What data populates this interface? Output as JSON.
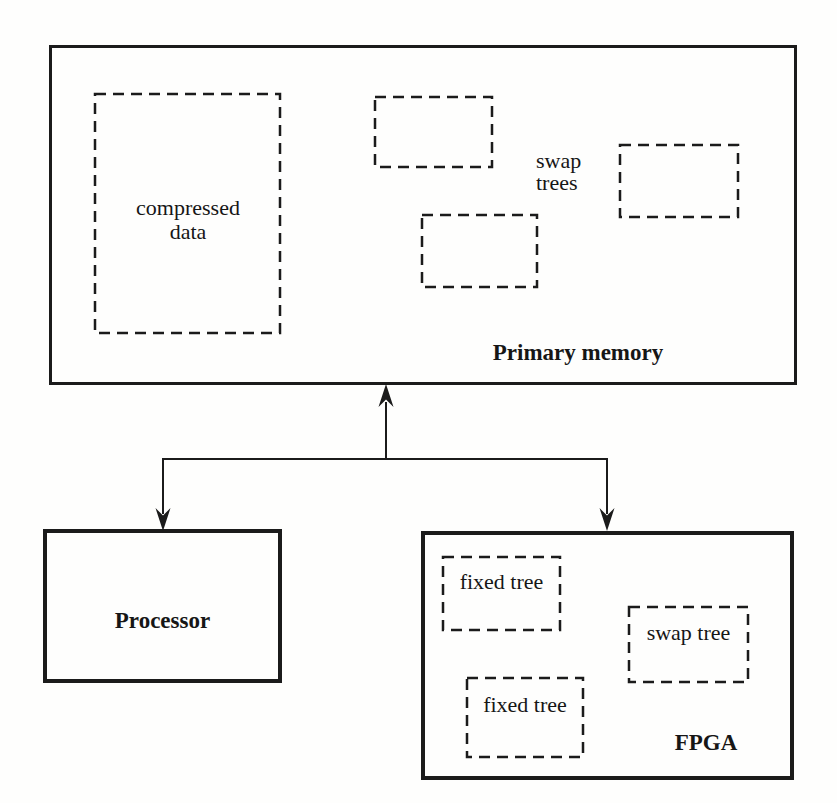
{
  "figure": {
    "primary_memory": {
      "label": "Primary memory",
      "compressed_data_label": "compressed data",
      "swap_trees_label": "swap trees"
    },
    "processor": {
      "label": "Processor"
    },
    "fpga": {
      "label": "FPGA",
      "fixed_tree_top_label": "fixed tree",
      "fixed_tree_bottom_label": "fixed tree",
      "swap_tree_label": "swap tree"
    },
    "colors": {
      "ink": "#1b1b1b",
      "background": "#fefefd"
    }
  }
}
